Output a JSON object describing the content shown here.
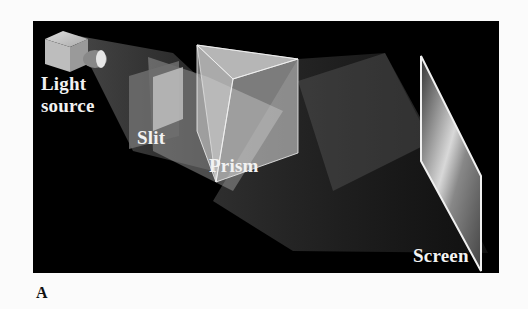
{
  "figure": {
    "panel_label": "A",
    "background_color": "#000000",
    "labels": {
      "light_source_line1": "Light",
      "light_source_line2": "source",
      "slit": "Slit",
      "prism": "Prism",
      "screen": "Screen"
    },
    "components": [
      {
        "id": "light-source",
        "description": "Box-shaped lamp emitting a beam"
      },
      {
        "id": "slit",
        "description": "Translucent plate with a slit"
      },
      {
        "id": "prism",
        "description": "Transparent triangular prism"
      },
      {
        "id": "screen",
        "description": "Tilted screen receiving dispersed light"
      }
    ]
  }
}
